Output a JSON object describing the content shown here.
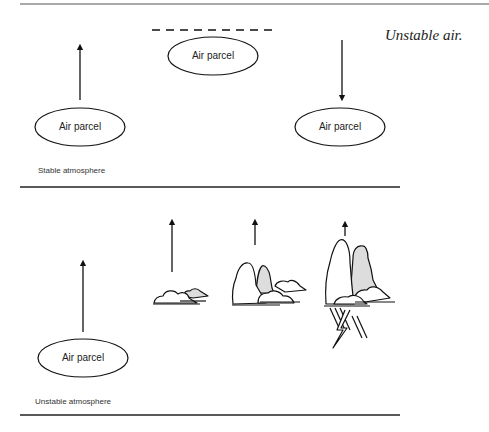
{
  "figure": {
    "caption": "Unstable air.",
    "stable_panel": {
      "label": "Stable atmosphere",
      "parcels": [
        {
          "label": "Air parcel",
          "position": "bottom-left",
          "arrow": "up"
        },
        {
          "label": "Air parcel",
          "position": "top-center",
          "boundary": "dashed-line"
        },
        {
          "label": "Air parcel",
          "position": "bottom-right",
          "arrow": "down"
        }
      ]
    },
    "unstable_panel": {
      "label": "Unstable atmosphere",
      "parcels": [
        {
          "label": "Air parcel",
          "position": "bottom-left",
          "arrow": "up"
        }
      ],
      "cloud_stages": [
        "small cumulus",
        "towering cumulus",
        "cumulonimbus with lightning and rain"
      ]
    }
  }
}
